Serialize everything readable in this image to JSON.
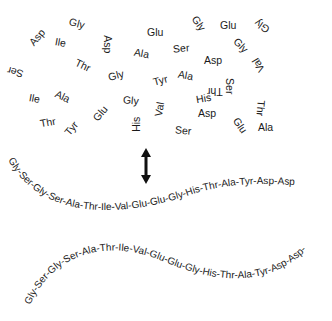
{
  "figure": {
    "scattered_amino_acids": [
      {
        "label": "Asp",
        "x": 28,
        "y": 32,
        "rot": -50
      },
      {
        "label": "Gly",
        "x": 69,
        "y": 18,
        "rot": 15
      },
      {
        "label": "Ile",
        "x": 55,
        "y": 37,
        "rot": 10
      },
      {
        "label": "Asp",
        "x": 99,
        "y": 39,
        "rot": 90
      },
      {
        "label": "Glu",
        "x": 147,
        "y": 27,
        "rot": 0
      },
      {
        "label": "Gly",
        "x": 191,
        "y": 18,
        "rot": 55
      },
      {
        "label": "Glu",
        "x": 220,
        "y": 20,
        "rot": 0
      },
      {
        "label": "Gly",
        "x": 254,
        "y": 21,
        "rot": 215
      },
      {
        "label": "Ser",
        "x": 7,
        "y": 67,
        "rot": 195
      },
      {
        "label": "Thr",
        "x": 75,
        "y": 60,
        "rot": 25
      },
      {
        "label": "Ala",
        "x": 134,
        "y": 48,
        "rot": 10
      },
      {
        "label": "Ser",
        "x": 173,
        "y": 43,
        "rot": -5
      },
      {
        "label": "Gly",
        "x": 233,
        "y": 40,
        "rot": 45
      },
      {
        "label": "Asp",
        "x": 204,
        "y": 55,
        "rot": 0
      },
      {
        "label": "Gly",
        "x": 108,
        "y": 70,
        "rot": -15
      },
      {
        "label": "Tyr",
        "x": 153,
        "y": 75,
        "rot": -15
      },
      {
        "label": "Ala",
        "x": 178,
        "y": 70,
        "rot": 10
      },
      {
        "label": "Val",
        "x": 251,
        "y": 60,
        "rot": 240
      },
      {
        "label": "Ile",
        "x": 29,
        "y": 93,
        "rot": 10
      },
      {
        "label": "Ala",
        "x": 55,
        "y": 91,
        "rot": 25
      },
      {
        "label": "Gly",
        "x": 123,
        "y": 95,
        "rot": 5
      },
      {
        "label": "His",
        "x": 196,
        "y": 93,
        "rot": -10
      },
      {
        "label": "Thr",
        "x": 207,
        "y": 86,
        "rot": 180
      },
      {
        "label": "Ser",
        "x": 222,
        "y": 81,
        "rot": 90
      },
      {
        "label": "Val",
        "x": 152,
        "y": 104,
        "rot": -80
      },
      {
        "label": "Thr",
        "x": 40,
        "y": 117,
        "rot": -10
      },
      {
        "label": "Tyr",
        "x": 64,
        "y": 123,
        "rot": -50
      },
      {
        "label": "Glu",
        "x": 92,
        "y": 108,
        "rot": -50
      },
      {
        "label": "His",
        "x": 129,
        "y": 119,
        "rot": -90
      },
      {
        "label": "Asp",
        "x": 198,
        "y": 108,
        "rot": 0
      },
      {
        "label": "Ser",
        "x": 175,
        "y": 125,
        "rot": 5
      },
      {
        "label": "Thr",
        "x": 253,
        "y": 103,
        "rot": 95
      },
      {
        "label": "Glu",
        "x": 232,
        "y": 120,
        "rot": 55
      },
      {
        "label": "Ala",
        "x": 258,
        "y": 122,
        "rot": 0
      }
    ],
    "arrow": {
      "type": "double-headed-vertical",
      "color": "#111111"
    },
    "sequence_upper": "Gly-Ser-Gly-Ser-Ala-Thr-Ile-Val-Glu-Glu-Gly-His-Thr-Ala-Tyr-Asp-Asp",
    "sequence_lower": "Gly-Ser-Gly-Ser-Ala-Thr-Ile-Val-Glu-Glu-Gly-His-Thr-Ala-Tyr-Asp-Asp-"
  }
}
